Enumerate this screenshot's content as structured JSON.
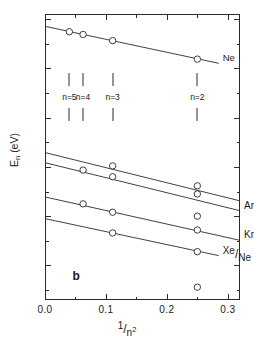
{
  "figure": {
    "panel_label": "b",
    "background": "#ffffff",
    "ink_color": "#2b2b2b"
  },
  "chart_data": {
    "type": "scatter",
    "title": "",
    "xlabel": "1/n²",
    "ylabel": "Eₙ (eV)",
    "xlim": [
      0.0,
      0.32
    ],
    "ylim": [
      10.6,
      22.2
    ],
    "grid": false,
    "legend": "inline-right-end-labels",
    "marker": "open-circle",
    "xticks": [
      0.0,
      0.1,
      0.2,
      0.3
    ],
    "xtick_labels": [
      "0.0",
      "0.1",
      "0.2",
      "0.3"
    ],
    "xticks_minor": [
      0.05,
      0.15,
      0.25
    ],
    "yticks": [
      12,
      14,
      16,
      18,
      20,
      22
    ],
    "ytick_labels": [
      "12",
      "14",
      "16",
      "18",
      "20",
      "22"
    ],
    "yticks_minor": [
      11,
      13,
      15,
      17,
      19,
      21
    ],
    "annotations": [
      {
        "text": "n=5",
        "x": 0.04,
        "y": 18.85
      },
      {
        "text": "n=4",
        "x": 0.0625,
        "y": 18.85
      },
      {
        "text": "n=3",
        "x": 0.111,
        "y": 18.85
      },
      {
        "text": "n=2",
        "x": 0.25,
        "y": 18.85
      }
    ],
    "series": [
      {
        "name": "Ne",
        "label": "Ne",
        "label_num": "Ne",
        "label_den": "",
        "fit_line": {
          "x0": 0.0,
          "y0": 21.7,
          "x1": 0.285,
          "y1": 20.2
        },
        "x": [
          0.04,
          0.0625,
          0.111,
          0.25
        ],
        "y": [
          21.48,
          21.37,
          21.12,
          20.37
        ]
      },
      {
        "name": "Ar/Ne upper",
        "label": "",
        "label_num": "",
        "label_den": "",
        "fit_line": {
          "x0": 0.0,
          "y0": 16.58,
          "x1": 0.32,
          "y1": 14.62
        },
        "x": [
          0.111,
          0.25
        ],
        "y": [
          16.04,
          15.23
        ]
      },
      {
        "name": "Ar/Ne",
        "label": "Ar/Ne",
        "label_num": "Ar",
        "label_den": "Ne",
        "fit_line": {
          "x0": 0.0,
          "y0": 16.17,
          "x1": 0.32,
          "y1": 14.22
        },
        "x": [
          0.0625,
          0.111,
          0.25
        ],
        "y": [
          15.87,
          15.6,
          14.9
        ]
      },
      {
        "name": "Kr/Ne",
        "label": "Kr/Ne",
        "label_num": "Kr",
        "label_den": "Ne",
        "fit_line": {
          "x0": 0.0,
          "y0": 14.78,
          "x1": 0.32,
          "y1": 13.02
        },
        "x": [
          0.0625,
          0.111,
          0.25
        ],
        "y": [
          14.5,
          14.16,
          13.44
        ]
      },
      {
        "name": "Xe/Ne",
        "label": "Xe/Ne",
        "label_num": "Xe",
        "label_den": "Ne",
        "fit_line": {
          "x0": 0.0,
          "y0": 13.9,
          "x1": 0.285,
          "y1": 12.4
        },
        "x": [
          0.111,
          0.25
        ],
        "y": [
          13.32,
          12.56
        ]
      }
    ],
    "outlier_points": [
      {
        "x": 0.25,
        "y": 14.0,
        "near_label": "Kr/Ne"
      },
      {
        "x": 0.25,
        "y": 11.12,
        "near_label": ""
      }
    ]
  }
}
